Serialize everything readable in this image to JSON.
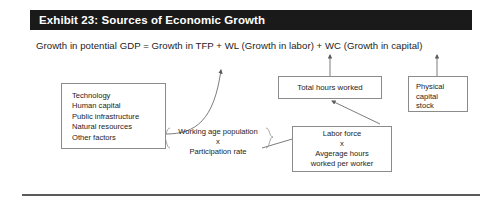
{
  "exhibit": {
    "title": "Exhibit 23: Sources of Economic Growth",
    "equation": "Growth in potential GDP = Growth in TFP + WL (Growth in labor) + WC (Growth in capital)"
  },
  "diagram": {
    "type": "flow",
    "factors_box": {
      "name": "sources-of-tfp-growth",
      "items": [
        "Technology",
        "Human capital",
        "Public infrastructure",
        "Natural resources",
        "Other factors"
      ]
    },
    "working_age_group": {
      "line1": "Working age population",
      "operator": "x",
      "line2": "Participation rate"
    },
    "total_hours_box": {
      "label": "Total hours worked"
    },
    "labor_force_box": {
      "line1": "Labor force",
      "operator": "x",
      "line2": "Avgerage hours",
      "line3": "worked per worker"
    },
    "capital_box": {
      "line1": "Physical",
      "line2": "capital",
      "line3": "stock"
    }
  },
  "style": {
    "title_bar_color": "#1a1a1a",
    "title_text_color": "#ffffff",
    "box_border_color": "#8b8b8b",
    "text_color": "#1c1c1c",
    "connector_color": "#6e6e6e",
    "rule_color": "#5a5a5a",
    "background": "#ffffff"
  }
}
